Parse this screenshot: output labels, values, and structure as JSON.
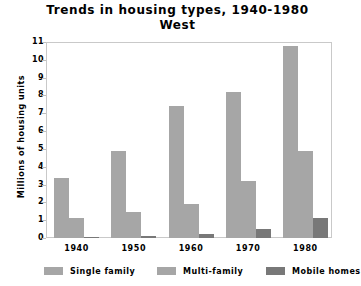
{
  "chart_data": {
    "type": "bar",
    "title": "Trends in housing types, 1940-1980",
    "subtitle": "West",
    "xlabel": "",
    "ylabel": "Millions of housing units",
    "ylim": [
      0,
      11
    ],
    "yticks": [
      0,
      1,
      2,
      3,
      4,
      5,
      6,
      7,
      8,
      9,
      10,
      11
    ],
    "ytick_labels": [
      "0",
      "1",
      "2",
      "3",
      "4",
      "5",
      "6",
      "7",
      "8",
      "9",
      "10",
      "11"
    ],
    "categories": [
      "1940",
      "1950",
      "1960",
      "1970",
      "1980"
    ],
    "grid": false,
    "legend_position": "bottom",
    "series": [
      {
        "name": "Single family",
        "color": "#a6a6a6",
        "values": [
          3.35,
          4.9,
          7.4,
          8.2,
          10.8
        ]
      },
      {
        "name": "Multi-family",
        "color": "#a6a6a6",
        "values": [
          1.1,
          1.45,
          1.9,
          3.2,
          4.9
        ]
      },
      {
        "name": "Mobile homes",
        "color": "#787878",
        "values": [
          0.05,
          0.12,
          0.25,
          0.5,
          1.1
        ]
      }
    ]
  },
  "legend": {
    "items": [
      {
        "label": "Single family",
        "color": "#a6a6a6"
      },
      {
        "label": "Multi-family",
        "color": "#a6a6a6"
      },
      {
        "label": "Mobile homes",
        "color": "#787878"
      }
    ]
  }
}
